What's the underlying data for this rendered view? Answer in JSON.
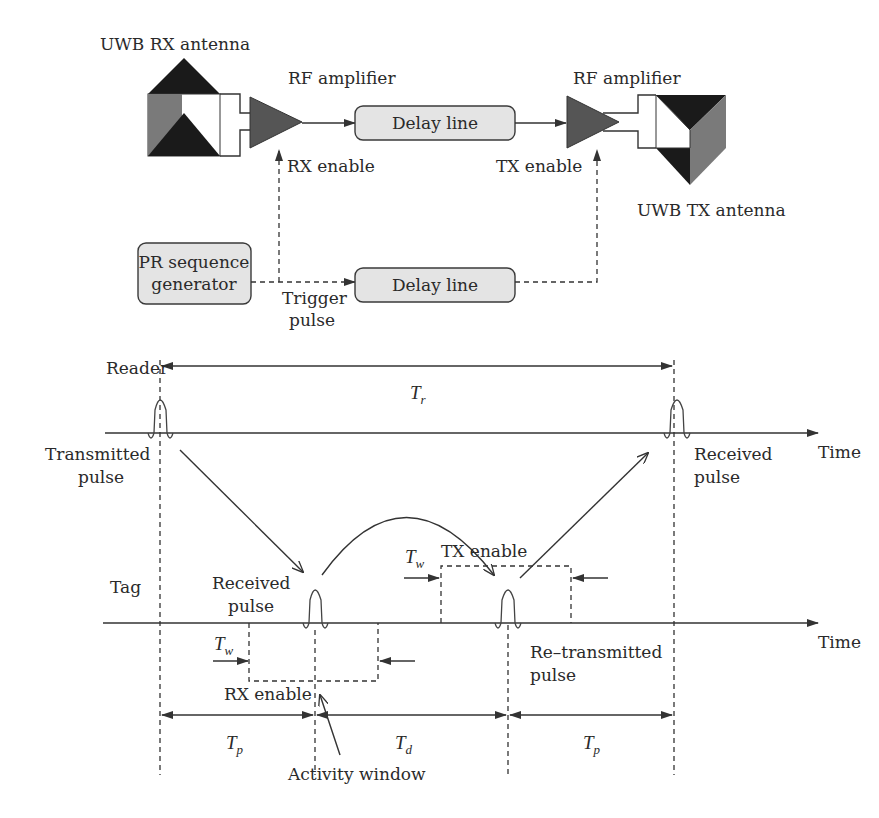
{
  "block_diagram": {
    "rx_antenna_label": "UWB RX antenna",
    "rx_amplifier_label": "RF amplifier",
    "tx_amplifier_label": "RF amplifier",
    "tx_antenna_label": "UWB TX antenna",
    "delay_line_top_label": "Delay line",
    "delay_line_bottom_label": "Delay line",
    "rx_enable_label": "RX enable",
    "tx_enable_label": "TX enable",
    "pr_generator_line1": "PR sequence",
    "pr_generator_line2": "generator",
    "trigger_line1": "Trigger",
    "trigger_line2": "pulse",
    "colors": {
      "box_fill": "#e4e4e4",
      "amplifier_fill": "#555555",
      "antenna_dark": "#1a1a1a",
      "antenna_mid": "#7a7a7a"
    }
  },
  "timing_diagram": {
    "reader_label": "Reader",
    "tag_label": "Tag",
    "tr_symbol": "T",
    "tr_sub": "r",
    "transmitted_line1": "Transmitted",
    "transmitted_line2": "pulse",
    "received_reader_line1": "Received",
    "received_reader_line2": "pulse",
    "time_axis_reader": "Time",
    "time_axis_tag": "Time",
    "received_tag_line1": "Received",
    "received_tag_line2": "pulse",
    "retransmitted_line1": "Re–transmitted",
    "retransmitted_line2": "pulse",
    "rx_enable_label": "RX enable",
    "tx_enable_label": "TX enable",
    "tw_symbol": "T",
    "tw_sub": "w",
    "tp_symbol": "T",
    "tp_sub": "p",
    "td_symbol": "T",
    "td_sub": "d",
    "activity_window_label": "Activity window"
  }
}
